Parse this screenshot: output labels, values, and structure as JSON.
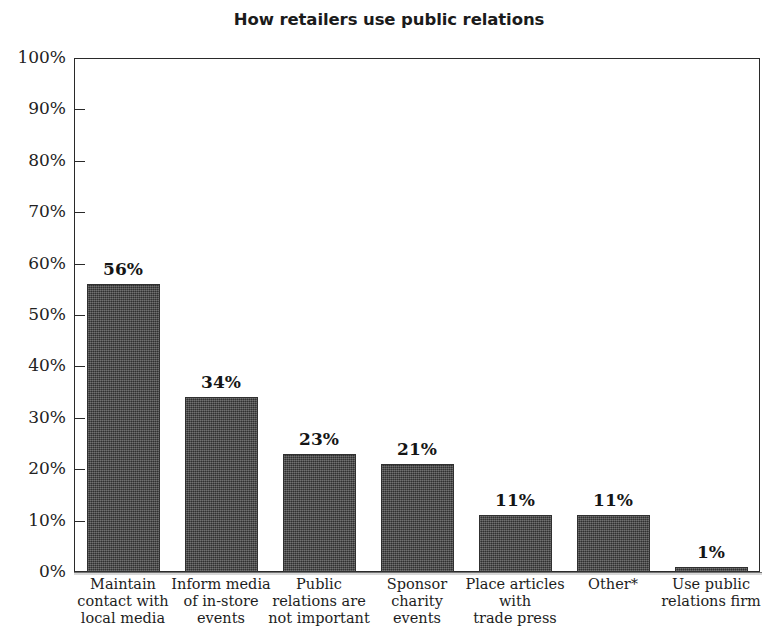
{
  "chart": {
    "title": "How retailers use public relations",
    "axis_color": "#2a2a2a",
    "bar_color": "#3d3d3d",
    "background": "#ffffff"
  },
  "chart_data": {
    "type": "bar",
    "title": "How retailers use public relations",
    "xlabel": "",
    "ylabel": "",
    "ylim": [
      0,
      100
    ],
    "y_unit": "%",
    "grid": false,
    "legend": "none",
    "y_ticks": [
      "0%",
      "10%",
      "20%",
      "30%",
      "40%",
      "50%",
      "60%",
      "70%",
      "80%",
      "90%",
      "100%"
    ],
    "y_tick_values": [
      0,
      10,
      20,
      30,
      40,
      50,
      60,
      70,
      80,
      90,
      100
    ],
    "categories": [
      "Maintain contact with local media",
      "Inform media of in-store events",
      "Public relations are not important",
      "Sponsor charity events",
      "Place articles with trade press",
      "Other*",
      "Use public relations firm"
    ],
    "category_lines": [
      [
        "Maintain",
        "contact with",
        "local media"
      ],
      [
        "Inform media",
        "of in-store",
        "events"
      ],
      [
        "Public",
        "relations are",
        "not important"
      ],
      [
        "Sponsor",
        "charity",
        "events"
      ],
      [
        "Place articles",
        "with",
        "trade press"
      ],
      [
        "Other*"
      ],
      [
        "Use public",
        "relations firm"
      ]
    ],
    "values": [
      56,
      34,
      23,
      21,
      11,
      11,
      1
    ],
    "data_labels": [
      "56%",
      "34%",
      "23%",
      "21%",
      "11%",
      "11%",
      "1%"
    ]
  }
}
